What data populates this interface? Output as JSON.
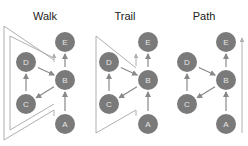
{
  "panels": [
    {
      "id": "walk",
      "title": "Walk",
      "nodes": [
        {
          "label": "E"
        },
        {
          "label": "D"
        },
        {
          "label": "B"
        },
        {
          "label": "C"
        },
        {
          "label": "A"
        }
      ],
      "edges": [
        [
          "A",
          "B"
        ],
        [
          "B",
          "E"
        ],
        [
          "B",
          "C"
        ],
        [
          "C",
          "D"
        ],
        [
          "D",
          "B"
        ]
      ],
      "traversal": "A→B→C→D→B→E (repeats vertex B and edge use; double outline)"
    },
    {
      "id": "trail",
      "title": "Trail",
      "nodes": [
        {
          "label": "E"
        },
        {
          "label": "D"
        },
        {
          "label": "B"
        },
        {
          "label": "C"
        },
        {
          "label": "A"
        }
      ],
      "edges": [
        [
          "A",
          "B"
        ],
        [
          "B",
          "E"
        ],
        [
          "B",
          "C"
        ],
        [
          "C",
          "D"
        ],
        [
          "D",
          "B"
        ]
      ],
      "traversal": "A→B→C→D→B→E (no repeated edges; single outline)"
    },
    {
      "id": "path",
      "title": "Path",
      "nodes": [
        {
          "label": "E"
        },
        {
          "label": "D"
        },
        {
          "label": "B"
        },
        {
          "label": "C"
        },
        {
          "label": "A"
        }
      ],
      "edges": [
        [
          "A",
          "B"
        ],
        [
          "B",
          "E"
        ],
        [
          "B",
          "C"
        ],
        [
          "C",
          "D"
        ],
        [
          "D",
          "B"
        ]
      ],
      "traversal": "A→B→E (straight arrow)"
    }
  ],
  "colors": {
    "node_fill": "#7a7a7a",
    "node_label": "#e6e6e6",
    "edge": "#888888",
    "outline": "#b0b0b0",
    "title": "#222222"
  }
}
